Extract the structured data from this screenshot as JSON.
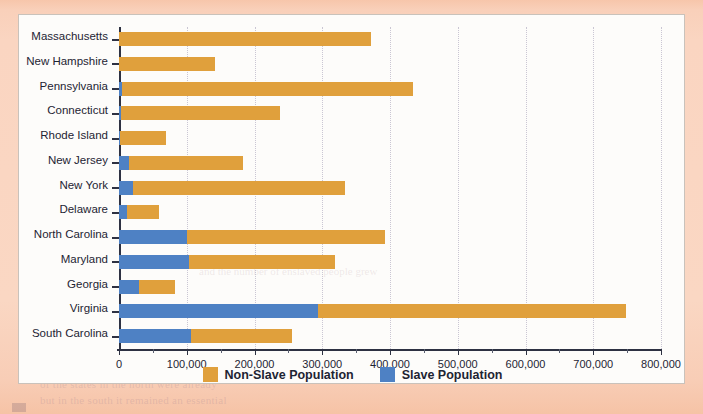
{
  "page": {
    "background_color": "#f9d2bd",
    "panel_color": "#fdfcfa",
    "ghost_text": [
      "of the states in the north were already",
      "but in the south it remained an essential",
      "and the number of enslaved people grew"
    ]
  },
  "chart_data": {
    "type": "bar",
    "orientation": "horizontal",
    "stacked": true,
    "title": "",
    "subtitle": "",
    "xlabel": "",
    "ylabel": "",
    "xlim": [
      0,
      800000
    ],
    "xticks": [
      0,
      100000,
      200000,
      300000,
      400000,
      500000,
      600000,
      700000,
      800000
    ],
    "xtick_labels": [
      "0",
      "100,000",
      "200,000",
      "300,000",
      "400,000",
      "500,000",
      "600,000",
      "700,000",
      "800,000"
    ],
    "xtick_minor_step": 50000,
    "grid": true,
    "grid_style": "dotted-vertical",
    "legend_position": "bottom-center",
    "categories": [
      "Massachusetts",
      "New Hampshire",
      "Pennsylvania",
      "Connecticut",
      "Rhode Island",
      "New Jersey",
      "New York",
      "Delaware",
      "North Carolina",
      "Maryland",
      "Georgia",
      "Virginia",
      "South Carolina"
    ],
    "series": [
      {
        "name": "Slave Population",
        "color": "#4e81c4",
        "values": [
          0,
          0,
          4000,
          3000,
          1000,
          15000,
          21000,
          12000,
          101000,
          104000,
          29000,
          293000,
          107000
        ]
      },
      {
        "name": "Non-Slave Population",
        "color": "#e0a03c",
        "values": [
          372000,
          141000,
          430000,
          235000,
          68000,
          168000,
          312000,
          47000,
          292000,
          215000,
          53000,
          455000,
          148000
        ]
      }
    ],
    "totals": [
      372000,
      141000,
      434000,
      238000,
      69000,
      183000,
      333000,
      59000,
      393000,
      319000,
      82000,
      748000,
      255000
    ]
  },
  "legend": {
    "items": [
      {
        "label": "Non-Slave Population",
        "color": "#e0a03c",
        "swatch": "orange-swatch"
      },
      {
        "label": "Slave Population",
        "color": "#4e81c4",
        "swatch": "blue-swatch"
      }
    ]
  }
}
